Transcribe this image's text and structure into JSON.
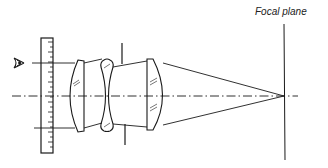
{
  "diagram": {
    "type": "optical-ray-diagram",
    "labels": {
      "focal_plane": "Focal plane"
    },
    "elements": [
      {
        "name": "eye-symbol",
        "description": "observer eye on left"
      },
      {
        "name": "scale-ruler",
        "description": "vertical graduated scale (object)"
      },
      {
        "name": "lens-1",
        "description": "plano-convex positive lens"
      },
      {
        "name": "lens-2",
        "description": "biconcave negative lens"
      },
      {
        "name": "aperture-stop",
        "description": "vertical stop lines above and below axis"
      },
      {
        "name": "lens-3",
        "description": "convex positive lens"
      },
      {
        "name": "optical-axis",
        "description": "dash-dot centre line"
      },
      {
        "name": "focal-plane",
        "description": "vertical line where rays converge"
      }
    ],
    "colors": {
      "ink": "#1a1a1a",
      "background": "#ffffff"
    }
  }
}
